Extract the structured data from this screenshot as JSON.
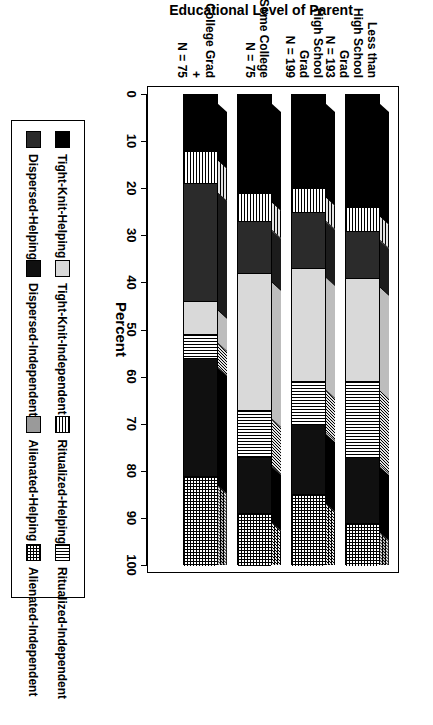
{
  "chart_data": {
    "type": "bar",
    "subtype": "stacked-horizontal-3d",
    "title": "",
    "xlabel": "Percent",
    "ylabel": "Educational Level of Parent",
    "xlim": [
      0,
      100
    ],
    "xticks": [
      0,
      10,
      20,
      30,
      40,
      50,
      60,
      70,
      80,
      90,
      100
    ],
    "xtick_labels": [
      "0",
      "10",
      "20",
      "30",
      "40",
      "50",
      "60",
      "70",
      "80",
      "90",
      "100"
    ],
    "grid": false,
    "legend_position": "bottom",
    "categories": [
      "Less than High School Grad\nN = 193",
      "High School Grad\nN = 199",
      "Some College\nN = 75",
      "College Grad +\nN = 75"
    ],
    "category_lines": [
      [
        "Less than High School Grad",
        "N = 193"
      ],
      [
        "High School Grad",
        "N = 199"
      ],
      [
        "Some College",
        "N = 75"
      ],
      [
        "College Grad +",
        "N = 75"
      ]
    ],
    "series": [
      {
        "name": "Tight-Knit-Helping",
        "key": "tkh",
        "pattern": "solid-black",
        "color": "#000000",
        "values": [
          24,
          20,
          21,
          12
        ]
      },
      {
        "name": "Ritualized-Helping",
        "key": "rh",
        "pattern": "horizontal-lines",
        "color": "#808080",
        "values": [
          5,
          5,
          6,
          7
        ]
      },
      {
        "name": "Dispersed-Helping",
        "key": "dh",
        "pattern": "dark-solid",
        "color": "#2b2b2b",
        "values": [
          10,
          12,
          11,
          25
        ]
      },
      {
        "name": "Alienated-Helping",
        "key": "ah",
        "pattern": "medium-grey",
        "color": "#9a9a9a",
        "values": [
          0,
          0,
          0,
          0
        ]
      },
      {
        "name": "Tight-Knit-Independent",
        "key": "tki",
        "pattern": "light-grey",
        "color": "#d9d9d9",
        "values": [
          22,
          24,
          29,
          7
        ]
      },
      {
        "name": "Ritualized-Independent",
        "key": "ri",
        "pattern": "vertical-lines",
        "color": "#808080",
        "values": [
          16,
          9,
          10,
          5
        ]
      },
      {
        "name": "Dispersed-Independent",
        "key": "di",
        "pattern": "black",
        "color": "#101010",
        "values": [
          14,
          15,
          12,
          25
        ]
      },
      {
        "name": "Alienated-Independent",
        "key": "ai",
        "pattern": "crosshatch",
        "color": "#bfbfbf",
        "values": [
          9,
          15,
          11,
          19
        ]
      }
    ],
    "stack_order": [
      "tkh",
      "rh",
      "dh",
      "tki",
      "ri",
      "di",
      "ai"
    ]
  },
  "axis": {
    "x_title": "Percent",
    "y_title": "Educational Level of Parent"
  },
  "legend": {
    "items": [
      {
        "label": "Tight-Knit-Helping",
        "key": "tkh"
      },
      {
        "label": "Ritualized-Helping",
        "key": "rh"
      },
      {
        "label": "Dispersed-Helping",
        "key": "dh"
      },
      {
        "label": "Alienated-Helping",
        "key": "ah"
      },
      {
        "label": "Tight-Knit-Independent",
        "key": "tki"
      },
      {
        "label": "Ritualized-Independent",
        "key": "ri"
      },
      {
        "label": "Dispersed-Independent",
        "key": "di"
      },
      {
        "label": "Alienated-Independent",
        "key": "ai"
      }
    ]
  }
}
